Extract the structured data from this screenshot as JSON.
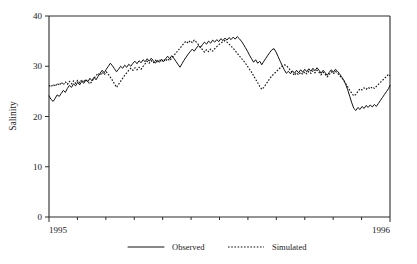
{
  "chart_data": {
    "type": "line",
    "title": "",
    "xlabel": "",
    "ylabel": "Salinity",
    "ylim": [
      0,
      40
    ],
    "yticks": [
      0,
      10,
      20,
      30,
      40
    ],
    "ytick_labels": [
      "0",
      "10",
      "20",
      "30",
      "40"
    ],
    "xlim": [
      1995.0,
      1996.0
    ],
    "xticks": [
      1995,
      1996
    ],
    "xtick_labels": [
      "1995",
      "1996"
    ],
    "x_minor_tick_count": 12,
    "grid": false,
    "legend_position": "bottom-center",
    "legend": [
      {
        "name": "Observed",
        "style": "solid"
      },
      {
        "name": "Simulated",
        "style": "dotted"
      }
    ],
    "series": [
      {
        "name": "Observed",
        "style": "solid",
        "color": "#111111",
        "x": [
          0.0,
          0.006,
          0.012,
          0.018,
          0.024,
          0.03,
          0.036,
          0.042,
          0.048,
          0.054,
          0.06,
          0.066,
          0.072,
          0.078,
          0.084,
          0.09,
          0.096,
          0.102,
          0.108,
          0.114,
          0.12,
          0.126,
          0.132,
          0.138,
          0.144,
          0.15,
          0.156,
          0.162,
          0.168,
          0.174,
          0.18,
          0.186,
          0.192,
          0.198,
          0.204,
          0.21,
          0.216,
          0.222,
          0.228,
          0.234,
          0.24,
          0.246,
          0.252,
          0.258,
          0.264,
          0.27,
          0.276,
          0.282,
          0.288,
          0.294,
          0.3,
          0.306,
          0.312,
          0.318,
          0.324,
          0.33,
          0.336,
          0.342,
          0.348,
          0.354,
          0.36,
          0.366,
          0.372,
          0.378,
          0.384,
          0.39,
          0.396,
          0.402,
          0.408,
          0.414,
          0.42,
          0.426,
          0.432,
          0.438,
          0.444,
          0.45,
          0.456,
          0.462,
          0.468,
          0.474,
          0.48,
          0.486,
          0.492,
          0.498,
          0.504,
          0.51,
          0.516,
          0.522,
          0.528,
          0.534,
          0.54,
          0.546,
          0.552,
          0.558,
          0.564,
          0.57,
          0.576,
          0.582,
          0.588,
          0.594,
          0.6,
          0.606,
          0.612,
          0.618,
          0.624,
          0.63,
          0.636,
          0.642,
          0.648,
          0.654,
          0.66,
          0.666,
          0.672,
          0.678,
          0.684,
          0.69,
          0.696,
          0.702,
          0.708,
          0.714,
          0.72,
          0.726,
          0.732,
          0.738,
          0.744,
          0.75,
          0.756,
          0.762,
          0.768,
          0.774,
          0.78,
          0.786,
          0.792,
          0.798,
          0.804,
          0.81,
          0.816,
          0.822,
          0.828,
          0.834,
          0.84,
          0.846,
          0.852,
          0.858,
          0.864,
          0.87,
          0.876,
          0.882,
          0.888,
          0.894,
          0.9,
          0.906,
          0.912,
          0.918,
          0.924,
          0.93,
          0.936,
          0.942,
          0.948,
          0.954,
          0.96,
          0.966,
          0.972,
          0.978,
          0.984,
          0.99,
          0.996,
          1.0
        ],
        "y": [
          24.1,
          23.4,
          23.0,
          23.6,
          24.3,
          24.0,
          24.6,
          25.2,
          24.8,
          25.6,
          26.2,
          25.8,
          26.5,
          26.1,
          26.8,
          26.3,
          27.0,
          26.6,
          27.3,
          26.9,
          27.6,
          27.1,
          27.8,
          27.3,
          28.0,
          28.6,
          29.2,
          28.7,
          29.4,
          30.0,
          30.6,
          30.1,
          29.5,
          28.9,
          29.4,
          30.0,
          29.6,
          30.2,
          29.8,
          30.4,
          30.0,
          30.6,
          31.0,
          30.5,
          31.1,
          30.7,
          31.3,
          30.9,
          31.5,
          31.0,
          31.6,
          31.1,
          30.6,
          31.2,
          30.8,
          31.4,
          30.9,
          31.5,
          32.0,
          31.5,
          32.1,
          31.6,
          31.0,
          30.4,
          29.8,
          30.5,
          31.2,
          31.8,
          32.4,
          32.9,
          33.4,
          33.0,
          33.6,
          34.1,
          33.7,
          34.3,
          34.8,
          34.4,
          35.0,
          34.6,
          35.2,
          34.8,
          35.3,
          34.9,
          35.5,
          35.1,
          35.6,
          35.2,
          35.7,
          35.3,
          35.8,
          35.4,
          35.9,
          35.5,
          35.0,
          34.4,
          33.7,
          33.0,
          32.2,
          31.5,
          30.8,
          31.3,
          30.6,
          31.0,
          30.3,
          31.0,
          31.6,
          32.2,
          32.8,
          33.3,
          33.5,
          32.8,
          31.9,
          31.0,
          30.1,
          29.3,
          28.6,
          29.0,
          28.5,
          29.1,
          28.6,
          29.2,
          28.7,
          29.3,
          28.8,
          29.4,
          28.9,
          29.5,
          29.0,
          29.6,
          29.1,
          29.7,
          29.2,
          28.6,
          29.2,
          28.7,
          28.2,
          28.8,
          29.3,
          28.8,
          29.4,
          29.0,
          28.5,
          27.9,
          27.3,
          26.4,
          25.3,
          24.0,
          22.7,
          21.6,
          21.2,
          21.8,
          21.4,
          22.0,
          21.6,
          22.2,
          21.8,
          22.3,
          21.9,
          22.4,
          22.0,
          22.6,
          23.2,
          23.8,
          24.4,
          25.0,
          25.6,
          26.2
        ]
      },
      {
        "name": "Simulated",
        "style": "dotted",
        "color": "#111111",
        "x": [
          0.0,
          0.006,
          0.012,
          0.018,
          0.024,
          0.03,
          0.036,
          0.042,
          0.048,
          0.054,
          0.06,
          0.066,
          0.072,
          0.078,
          0.084,
          0.09,
          0.096,
          0.102,
          0.108,
          0.114,
          0.12,
          0.126,
          0.132,
          0.138,
          0.144,
          0.15,
          0.156,
          0.162,
          0.168,
          0.174,
          0.18,
          0.186,
          0.192,
          0.198,
          0.204,
          0.21,
          0.216,
          0.222,
          0.228,
          0.234,
          0.24,
          0.246,
          0.252,
          0.258,
          0.264,
          0.27,
          0.276,
          0.282,
          0.288,
          0.294,
          0.3,
          0.306,
          0.312,
          0.318,
          0.324,
          0.33,
          0.336,
          0.342,
          0.348,
          0.354,
          0.36,
          0.366,
          0.372,
          0.378,
          0.384,
          0.39,
          0.396,
          0.402,
          0.408,
          0.414,
          0.42,
          0.426,
          0.432,
          0.438,
          0.444,
          0.45,
          0.456,
          0.462,
          0.468,
          0.474,
          0.48,
          0.486,
          0.492,
          0.498,
          0.504,
          0.51,
          0.516,
          0.522,
          0.528,
          0.534,
          0.54,
          0.546,
          0.552,
          0.558,
          0.564,
          0.57,
          0.576,
          0.582,
          0.588,
          0.594,
          0.6,
          0.606,
          0.612,
          0.618,
          0.624,
          0.63,
          0.636,
          0.642,
          0.648,
          0.654,
          0.66,
          0.666,
          0.672,
          0.678,
          0.684,
          0.69,
          0.696,
          0.702,
          0.708,
          0.714,
          0.72,
          0.726,
          0.732,
          0.738,
          0.744,
          0.75,
          0.756,
          0.762,
          0.768,
          0.774,
          0.78,
          0.786,
          0.792,
          0.798,
          0.804,
          0.81,
          0.816,
          0.822,
          0.828,
          0.834,
          0.84,
          0.846,
          0.852,
          0.858,
          0.864,
          0.87,
          0.876,
          0.882,
          0.888,
          0.894,
          0.9,
          0.906,
          0.912,
          0.918,
          0.924,
          0.93,
          0.936,
          0.942,
          0.948,
          0.954,
          0.96,
          0.966,
          0.972,
          0.978,
          0.984,
          0.99,
          0.996,
          1.0
        ],
        "y": [
          26.2,
          25.9,
          26.4,
          26.0,
          26.6,
          26.2,
          26.8,
          26.3,
          26.9,
          26.4,
          27.0,
          26.5,
          27.1,
          26.6,
          27.2,
          26.7,
          27.3,
          26.8,
          27.4,
          26.9,
          26.5,
          27.0,
          27.6,
          28.1,
          28.6,
          28.2,
          28.8,
          28.3,
          28.9,
          28.4,
          27.8,
          27.2,
          26.5,
          25.8,
          26.4,
          27.0,
          27.6,
          28.2,
          28.7,
          29.2,
          29.6,
          29.2,
          29.7,
          29.3,
          29.8,
          29.4,
          30.0,
          30.5,
          31.0,
          30.6,
          31.1,
          30.7,
          31.2,
          30.8,
          31.3,
          30.9,
          31.4,
          31.0,
          31.5,
          31.1,
          31.6,
          32.1,
          32.6,
          33.1,
          33.6,
          34.1,
          34.6,
          35.0,
          34.6,
          35.1,
          34.7,
          35.2,
          34.8,
          34.3,
          33.8,
          33.3,
          32.8,
          33.3,
          32.9,
          33.4,
          33.0,
          33.5,
          33.9,
          34.3,
          34.6,
          34.9,
          35.1,
          34.8,
          34.4,
          34.0,
          33.6,
          33.1,
          32.6,
          32.1,
          31.6,
          31.1,
          30.6,
          30.0,
          29.4,
          28.8,
          28.1,
          27.4,
          26.7,
          26.0,
          25.4,
          25.8,
          26.4,
          27.0,
          27.6,
          28.1,
          28.5,
          28.9,
          29.3,
          29.7,
          30.0,
          30.3,
          30.1,
          29.7,
          29.2,
          28.7,
          28.2,
          28.7,
          28.3,
          28.8,
          28.4,
          28.9,
          28.5,
          29.0,
          28.6,
          29.1,
          28.7,
          29.2,
          28.8,
          28.3,
          28.8,
          28.4,
          27.9,
          28.4,
          28.9,
          28.5,
          29.0,
          28.6,
          28.2,
          27.7,
          27.2,
          26.6,
          25.9,
          25.2,
          24.6,
          24.1,
          24.4,
          25.0,
          25.5,
          25.3,
          25.7,
          25.4,
          25.8,
          25.5,
          25.9,
          25.6,
          26.0,
          26.4,
          26.8,
          27.2,
          27.6,
          28.0,
          28.4,
          28.1
        ]
      }
    ]
  },
  "figure": {
    "background_color": "#ffffff",
    "axis_color": "#2b2b2b"
  }
}
